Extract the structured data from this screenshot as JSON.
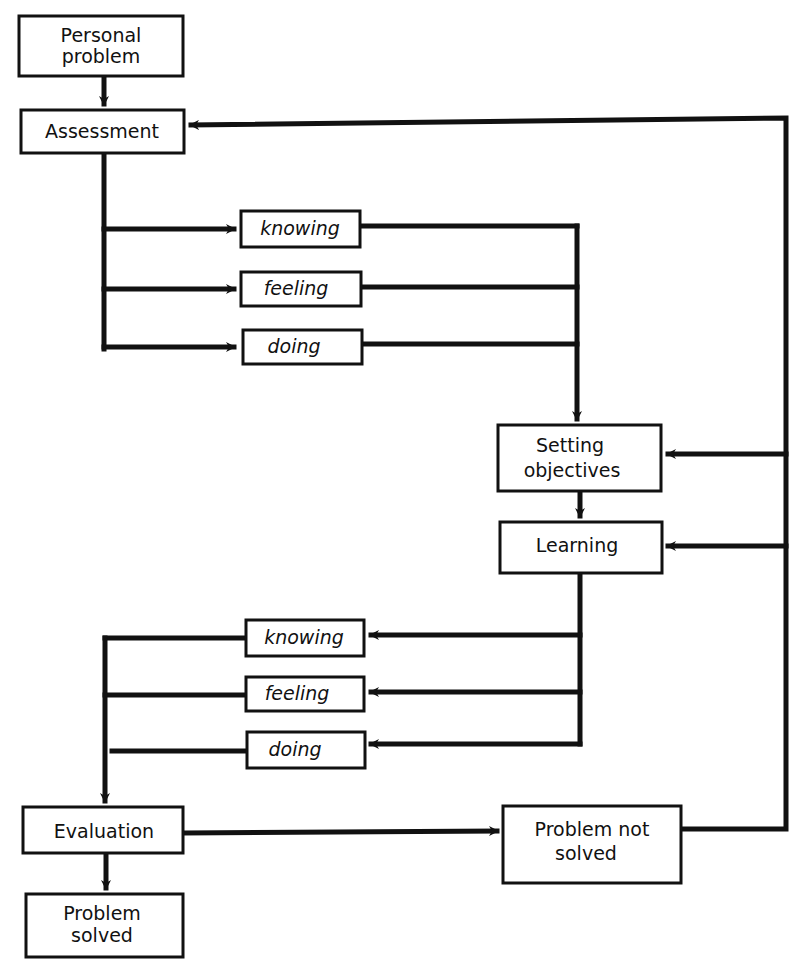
{
  "diagram": {
    "type": "flowchart",
    "nodes": {
      "personal_problem": {
        "line1": "Personal",
        "line2": "problem"
      },
      "assessment": {
        "label": "Assessment"
      },
      "upper_knowing": {
        "label": "knowing"
      },
      "upper_feeling": {
        "label": "feeling"
      },
      "upper_doing": {
        "label": "doing"
      },
      "setting_objectives": {
        "line1": "Setting",
        "line2": "objectives"
      },
      "learning": {
        "label": "Learning"
      },
      "lower_knowing": {
        "label": "knowing"
      },
      "lower_feeling": {
        "label": "feeling"
      },
      "lower_doing": {
        "label": "doing"
      },
      "evaluation": {
        "label": "Evaluation"
      },
      "problem_solved": {
        "line1": "Problem",
        "line2": "solved"
      },
      "problem_not_solved": {
        "line1": "Problem not",
        "line2": "solved"
      }
    },
    "edges": [
      {
        "from": "Personal problem",
        "to": "Assessment"
      },
      {
        "from": "Assessment",
        "to": "knowing (upper)"
      },
      {
        "from": "Assessment",
        "to": "feeling (upper)"
      },
      {
        "from": "Assessment",
        "to": "doing (upper)"
      },
      {
        "from": "knowing/feeling/doing (upper)",
        "to": "Setting objectives"
      },
      {
        "from": "Setting objectives",
        "to": "Learning"
      },
      {
        "from": "Learning",
        "to": "knowing (lower)"
      },
      {
        "from": "Learning",
        "to": "feeling (lower)"
      },
      {
        "from": "Learning",
        "to": "doing (lower)"
      },
      {
        "from": "knowing/feeling/doing (lower)",
        "to": "Evaluation"
      },
      {
        "from": "Evaluation",
        "to": "Problem solved"
      },
      {
        "from": "Evaluation",
        "to": "Problem not solved"
      },
      {
        "from": "Problem not solved",
        "to": "Assessment"
      },
      {
        "from": "Problem not solved",
        "to": "Setting objectives"
      },
      {
        "from": "Problem not solved",
        "to": "Learning"
      }
    ],
    "colors": {
      "ink": "#111111",
      "background": "#ffffff"
    }
  }
}
